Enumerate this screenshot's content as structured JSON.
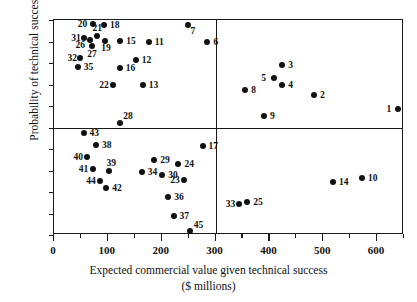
{
  "chart_data": {
    "type": "scatter",
    "title": "",
    "xlabel": "Expected commercial value given technical success",
    "xlabel_units": "($ millions)",
    "ylabel": "Probability of technical success",
    "xlim": [
      0,
      650
    ],
    "ylim": [
      0,
      1.0
    ],
    "grid": false,
    "legend": "none",
    "xticks_major": [
      0,
      100,
      200,
      300,
      400,
      500,
      600
    ],
    "xticks_minor": [
      50,
      150,
      250,
      350,
      450,
      550,
      650
    ],
    "xtick_labels": [
      "0",
      "100",
      "200",
      "300",
      "400",
      "500",
      "600"
    ],
    "yticks": [
      0,
      0.1,
      0.2,
      0.3,
      0.4,
      0.5,
      0.6,
      0.7,
      0.8,
      0.9,
      1.0
    ],
    "ytick_labels": [
      "0",
      ".1",
      ".2",
      ".3",
      ".4",
      ".5",
      ".6",
      ".7",
      ".8",
      ".9",
      "1.0"
    ],
    "quadrant_divider_x": 300,
    "quadrant_divider_y": 0.5,
    "point_color": "#111111",
    "axis_color": "#1a1a1a",
    "points": [
      {
        "label": "1",
        "x": 638,
        "y": 0.585,
        "lx": -11,
        "ly": -4
      },
      {
        "label": "2",
        "x": 483,
        "y": 0.65,
        "lx": 6,
        "ly": -4
      },
      {
        "label": "3",
        "x": 424,
        "y": 0.79,
        "lx": 6,
        "ly": -4
      },
      {
        "label": "4",
        "x": 424,
        "y": 0.7,
        "lx": 6,
        "ly": -4
      },
      {
        "label": "5",
        "x": 409,
        "y": 0.73,
        "lx": -13,
        "ly": -4
      },
      {
        "label": "6",
        "x": 285,
        "y": 0.9,
        "lx": 6,
        "ly": -4
      },
      {
        "label": "7",
        "x": 248,
        "y": 0.977,
        "lx": 3,
        "ly": 2
      },
      {
        "label": "8",
        "x": 355,
        "y": 0.675,
        "lx": 6,
        "ly": -4
      },
      {
        "label": "9",
        "x": 390,
        "y": 0.555,
        "lx": 6,
        "ly": -4
      },
      {
        "label": "10",
        "x": 572,
        "y": 0.263,
        "lx": 6,
        "ly": -4
      },
      {
        "label": "11",
        "x": 176,
        "y": 0.9,
        "lx": 6,
        "ly": -4
      },
      {
        "label": "12",
        "x": 152,
        "y": 0.812,
        "lx": 6,
        "ly": -4
      },
      {
        "label": "13",
        "x": 165,
        "y": 0.7,
        "lx": 6,
        "ly": -4
      },
      {
        "label": "14",
        "x": 518,
        "y": 0.245,
        "lx": 6,
        "ly": -4
      },
      {
        "label": "15",
        "x": 123,
        "y": 0.903,
        "lx": 6,
        "ly": -4
      },
      {
        "label": "16",
        "x": 122,
        "y": 0.778,
        "lx": 6,
        "ly": -4
      },
      {
        "label": "17",
        "x": 276,
        "y": 0.415,
        "lx": 6,
        "ly": -4
      },
      {
        "label": "18",
        "x": 93,
        "y": 0.978,
        "lx": 6,
        "ly": -4
      },
      {
        "label": "19",
        "x": 95,
        "y": 0.903,
        "lx": -4,
        "ly": 3
      },
      {
        "label": "20",
        "x": 72,
        "y": 0.982,
        "lx": -15,
        "ly": -4
      },
      {
        "label": "21",
        "x": 79,
        "y": 0.925,
        "lx": -4,
        "ly": -12
      },
      {
        "label": "22",
        "x": 110,
        "y": 0.7,
        "lx": -14,
        "ly": -4
      },
      {
        "label": "23",
        "x": 242,
        "y": 0.255,
        "lx": -14,
        "ly": -4
      },
      {
        "label": "24",
        "x": 231,
        "y": 0.33,
        "lx": 6,
        "ly": -4
      },
      {
        "label": "25",
        "x": 359,
        "y": 0.155,
        "lx": 6,
        "ly": -4
      },
      {
        "label": "26",
        "x": 66,
        "y": 0.905,
        "lx": -14,
        "ly": 1
      },
      {
        "label": "27",
        "x": 71,
        "y": 0.88,
        "lx": -5,
        "ly": 4
      },
      {
        "label": "28",
        "x": 123,
        "y": 0.522,
        "lx": 3,
        "ly": -11
      },
      {
        "label": "29",
        "x": 186,
        "y": 0.35,
        "lx": 6,
        "ly": -4
      },
      {
        "label": "30",
        "x": 201,
        "y": 0.277,
        "lx": 6,
        "ly": -4
      },
      {
        "label": "31",
        "x": 56,
        "y": 0.915,
        "lx": -13,
        "ly": -4
      },
      {
        "label": "32",
        "x": 49,
        "y": 0.825,
        "lx": -13,
        "ly": -4
      },
      {
        "label": "33",
        "x": 343,
        "y": 0.142,
        "lx": -13,
        "ly": -4
      },
      {
        "label": "34",
        "x": 163,
        "y": 0.293,
        "lx": 6,
        "ly": -4
      },
      {
        "label": "35",
        "x": 44,
        "y": 0.782,
        "lx": 6,
        "ly": -4
      },
      {
        "label": "36",
        "x": 212,
        "y": 0.178,
        "lx": 6,
        "ly": -4
      },
      {
        "label": "37",
        "x": 222,
        "y": 0.09,
        "lx": 6,
        "ly": -4
      },
      {
        "label": "38",
        "x": 78,
        "y": 0.418,
        "lx": 6,
        "ly": -4
      },
      {
        "label": "39",
        "x": 103,
        "y": 0.298,
        "lx": -3,
        "ly": -12
      },
      {
        "label": "40",
        "x": 62,
        "y": 0.365,
        "lx": -14,
        "ly": -4
      },
      {
        "label": "41",
        "x": 72,
        "y": 0.305,
        "lx": -14,
        "ly": -4
      },
      {
        "label": "42",
        "x": 97,
        "y": 0.22,
        "lx": 6,
        "ly": -4
      },
      {
        "label": "43",
        "x": 55,
        "y": 0.473,
        "lx": 6,
        "ly": -4
      },
      {
        "label": "44",
        "x": 86,
        "y": 0.25,
        "lx": -14,
        "ly": -4
      },
      {
        "label": "45",
        "x": 252,
        "y": 0.017,
        "lx": 4,
        "ly": -10
      }
    ]
  }
}
